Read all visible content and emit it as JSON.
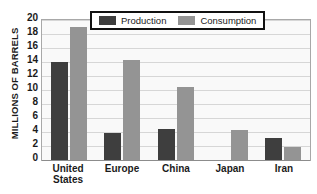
{
  "chart_data": {
    "type": "bar",
    "title": "",
    "xlabel": "",
    "ylabel": "MILLIONS OF BARRELS",
    "ylim": [
      0,
      20
    ],
    "yticks": [
      20,
      18,
      16,
      14,
      12,
      10,
      8,
      6,
      4,
      2,
      0
    ],
    "grid": true,
    "legend_position": "top-center",
    "categories": [
      "United\nStates",
      "Europe",
      "China",
      "Japan",
      "Iran"
    ],
    "category_labels": [
      {
        "line1": "United",
        "line2": "States"
      },
      {
        "line1": "Europe",
        "line2": ""
      },
      {
        "line1": "China",
        "line2": ""
      },
      {
        "line1": "Japan",
        "line2": ""
      },
      {
        "line1": "Iran",
        "line2": ""
      }
    ],
    "series": [
      {
        "name": "Production",
        "color": "#3e3e3e",
        "values": [
          14.0,
          3.8,
          4.5,
          0.0,
          3.2
        ]
      },
      {
        "name": "Consumption",
        "color": "#949494",
        "values": [
          19.0,
          14.3,
          10.4,
          4.3,
          1.8
        ]
      }
    ]
  },
  "legend": {
    "items": [
      {
        "label": "Production",
        "swatch": "production"
      },
      {
        "label": "Consumption",
        "swatch": "consumption"
      }
    ]
  },
  "colors": {
    "production": "#3e3e3e",
    "consumption": "#949494",
    "plot_background": "#f9f9f9",
    "gridline": "#d6d6d6",
    "axis": "#8c8c8c",
    "text": "#1b1b1b"
  }
}
